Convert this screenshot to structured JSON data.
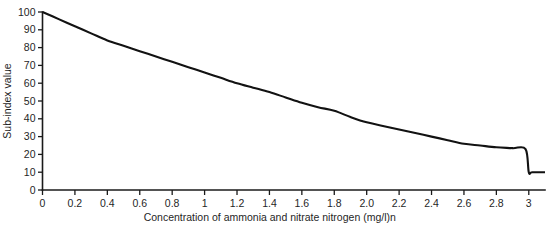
{
  "chart_data": {
    "type": "line",
    "title": "",
    "xlabel": "Concentration of ammonia and nitrate nitrogen (mg/l)n",
    "ylabel": "Sub-index value",
    "xlim": [
      0,
      3.1
    ],
    "ylim": [
      0,
      100
    ],
    "grid": false,
    "legend": null,
    "x_ticks": [
      0,
      0.2,
      0.4,
      0.6,
      0.8,
      1.0,
      1.2,
      1.4,
      1.6,
      1.8,
      2.0,
      2.2,
      2.4,
      2.6,
      2.8,
      3.0
    ],
    "x_tick_labels": [
      "0",
      "0.2",
      "0.4",
      "0.6",
      "0.8",
      "1",
      "1.2",
      "1.4",
      "1.6",
      "1.8",
      "2.0",
      "2.2",
      "2.4",
      "2.6",
      "2.8",
      "3"
    ],
    "y_ticks": [
      0,
      10,
      20,
      30,
      40,
      50,
      60,
      70,
      80,
      90,
      100
    ],
    "y_tick_labels": [
      "0",
      "10",
      "20",
      "30",
      "40",
      "50",
      "60",
      "70",
      "80",
      "90",
      "100"
    ],
    "series": [
      {
        "name": "Ammonia and nitrate nitrogen sub-index",
        "color": "#121212",
        "x": [
          0,
          0.1,
          0.2,
          0.3,
          0.4,
          0.5,
          0.6,
          0.7,
          0.8,
          0.9,
          1.0,
          1.1,
          1.2,
          1.3,
          1.4,
          1.5,
          1.6,
          1.7,
          1.8,
          1.9,
          2.0,
          2.1,
          2.2,
          2.3,
          2.4,
          2.5,
          2.6,
          2.7,
          2.8,
          2.9,
          2.98,
          3.0,
          3.02,
          3.1
        ],
        "y": [
          100,
          96,
          92,
          88,
          84,
          81,
          78,
          75,
          72,
          69,
          66,
          63,
          60,
          57.5,
          55,
          52,
          49,
          46.5,
          44.5,
          41,
          38,
          36,
          34,
          32,
          30,
          28,
          26,
          25,
          24,
          23.5,
          23,
          10,
          10,
          10
        ]
      }
    ]
  },
  "axis_labels": {
    "x_axis_title": "Concentration of ammonia and nitrate nitrogen (mg/l)n",
    "y_axis_title": "Sub-index value"
  }
}
